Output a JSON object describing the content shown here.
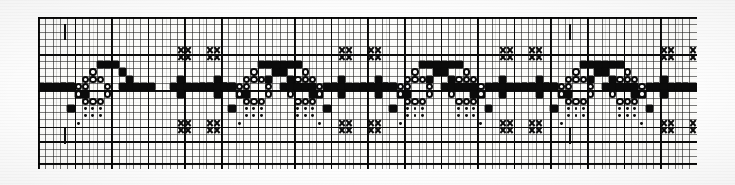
{
  "document": {
    "title": "Cross-Stitch Border Pattern Chart",
    "subtitle": "Repeating embroidery motif on graph paper",
    "medium": "printed graph paper chart",
    "caption": ""
  },
  "grid": {
    "cell_size_px": 7.32,
    "columns": 90,
    "rows": 20,
    "heavy_line_every": 5,
    "left_px": 38,
    "top_px": 17,
    "width_px": 659,
    "height_px": 152,
    "fine_line_color": "#1e1e1e",
    "heavy_line_color": "#000000",
    "paper_color": "#fdfdfb"
  },
  "band": {
    "top_rule_y_px": 36.6,
    "bottom_rule_y_px": 124.0,
    "rule_color": "#0a0a0a",
    "design_rows": 12
  },
  "legend": {
    "symbols": [
      {
        "key": "square",
        "name": "filled-square",
        "label": "Filled square",
        "color": "#0b0b0b"
      },
      {
        "key": "circle",
        "name": "open-circle",
        "label": "Open circle",
        "color": "#0b0b0b"
      },
      {
        "key": "dot",
        "name": "center-dot",
        "label": "Center dot",
        "color": "#0b0b0b"
      },
      {
        "key": "cross",
        "name": "cross-x",
        "label": "Cross / X",
        "color": "#0b0b0b"
      }
    ]
  },
  "repeat_ticks": [
    {
      "name": "tick-top-left",
      "x_px": 26,
      "y_px": 24,
      "orientation": "vertical"
    },
    {
      "name": "tick-bottom-left",
      "x_px": 26,
      "y_px": 128,
      "orientation": "vertical"
    },
    {
      "name": "tick-top-right",
      "x_px": 531,
      "y_px": 24,
      "orientation": "vertical"
    },
    {
      "name": "tick-bottom-right",
      "x_px": 531,
      "y_px": 128,
      "orientation": "vertical"
    }
  ],
  "chart_data": {
    "type": "heatmap",
    "title": "Cross-Stitch Border Pattern Chart",
    "xlabel": "",
    "ylabel": "",
    "grid": true,
    "legend_position": "none",
    "cols": 90,
    "rows": 20,
    "symbol_values": {
      "square": 1,
      "circle": 2,
      "dot": 3,
      "cross": 4,
      "empty": 0
    },
    "stitches": [
      {
        "s": "square",
        "c": 4,
        "r": 12
      },
      {
        "s": "square",
        "c": 5,
        "r": 10
      },
      {
        "s": "square",
        "c": 6,
        "r": 10
      },
      {
        "s": "circle",
        "c": 5,
        "r": 9
      },
      {
        "s": "circle",
        "c": 6,
        "r": 8
      },
      {
        "s": "circle",
        "c": 7,
        "r": 8
      },
      {
        "s": "circle",
        "c": 8,
        "r": 8
      },
      {
        "s": "circle",
        "c": 5,
        "r": 10
      },
      {
        "s": "circle",
        "c": 6,
        "r": 9
      },
      {
        "s": "circle",
        "c": 6,
        "r": 11
      },
      {
        "s": "circle",
        "c": 7,
        "r": 11
      },
      {
        "s": "circle",
        "c": 8,
        "r": 11
      },
      {
        "s": "circle",
        "c": 7,
        "r": 7
      },
      {
        "s": "circle",
        "c": 9,
        "r": 9
      },
      {
        "s": "circle",
        "c": 9,
        "r": 10
      },
      {
        "s": "square",
        "c": 3,
        "r": 9
      },
      {
        "s": "square",
        "c": 4,
        "r": 9
      },
      {
        "s": "square",
        "c": 8,
        "r": 6
      },
      {
        "s": "square",
        "c": 9,
        "r": 6
      },
      {
        "s": "square",
        "c": 10,
        "r": 6
      },
      {
        "s": "square",
        "c": 11,
        "r": 7
      },
      {
        "s": "square",
        "c": 12,
        "r": 8
      },
      {
        "s": "dot",
        "c": 6,
        "r": 12
      },
      {
        "s": "dot",
        "c": 7,
        "r": 12
      },
      {
        "s": "dot",
        "c": 8,
        "r": 12
      },
      {
        "s": "dot",
        "c": 6,
        "r": 13
      },
      {
        "s": "dot",
        "c": 7,
        "r": 13
      },
      {
        "s": "dot",
        "c": 8,
        "r": 13
      },
      {
        "s": "dot",
        "c": 5,
        "r": 14
      },
      {
        "s": "cross",
        "c": 19,
        "r": 4
      },
      {
        "s": "cross",
        "c": 20,
        "r": 4
      },
      {
        "s": "cross",
        "c": 19,
        "r": 5
      },
      {
        "s": "cross",
        "c": 20,
        "r": 5
      },
      {
        "s": "cross",
        "c": 19,
        "r": 14
      },
      {
        "s": "cross",
        "c": 20,
        "r": 14
      },
      {
        "s": "cross",
        "c": 19,
        "r": 15
      },
      {
        "s": "cross",
        "c": 20,
        "r": 15
      },
      {
        "s": "square",
        "c": 18,
        "r": 9
      },
      {
        "s": "square",
        "c": 19,
        "r": 9
      },
      {
        "s": "square",
        "c": 20,
        "r": 9
      },
      {
        "s": "square",
        "c": 21,
        "r": 9
      },
      {
        "s": "square",
        "c": 19,
        "r": 8
      },
      {
        "s": "square",
        "c": 19,
        "r": 10
      }
    ]
  }
}
